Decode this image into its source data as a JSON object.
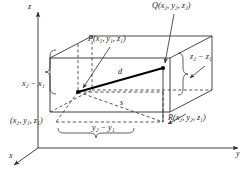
{
  "figure": {
    "type": "3d-distance-box-diagram",
    "axes": {
      "z_label": "z",
      "y_label": "y",
      "x_label": "x"
    },
    "points": {
      "P": {
        "name": "P",
        "coords": "(x₁, y₁, z₁)",
        "full": "P(x₁, y₁, z₁)"
      },
      "Q": {
        "name": "Q",
        "coords": "(x₂, y₂, z₂)",
        "full": "Q(x₂, y₂, z₂)"
      },
      "R": {
        "name": "R",
        "coords": "(x₂, y₂, z₁)",
        "full": "R(x₂, y₂, z₁)"
      },
      "origin_corner": {
        "name": "",
        "coords": "(x₂, y₁, z₁)",
        "full": "(x₂, y₁, z₁)"
      }
    },
    "segments": {
      "d_label": "d",
      "s_label": "s"
    },
    "dimensions": {
      "x_extent": "x₂ − x₁",
      "y_extent": "y₂ − y₁",
      "z_extent": "z₂ − z₁"
    },
    "colors": {
      "stroke": "#2b2b2b",
      "thick_segment": "#000000",
      "background": "#ffffff"
    }
  }
}
